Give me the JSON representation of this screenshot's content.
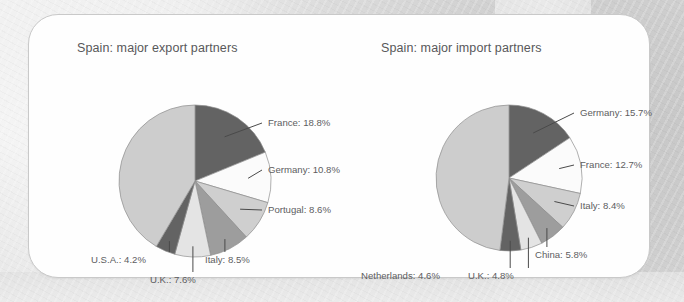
{
  "background": {
    "paper_color": "#d8d8d8",
    "card_color": "#fefefe"
  },
  "palette": {
    "dark_gray": "#636363",
    "white": "#fbfbfb",
    "light_gray": "#cfcfcf",
    "medium_gray": "#9d9d9d",
    "very_light_gray": "#e4e4e4",
    "remainder_gray": "#cdcdcd",
    "outline": "#8e8e8e",
    "text": "#5d5d5f",
    "title_text": "#58585a"
  },
  "chart_data": [
    {
      "type": "pie",
      "id": "export",
      "title": "Spain: major export partners",
      "start_angle_deg": 0,
      "direction": "clockwise",
      "unit": "%",
      "center": {
        "x": 166,
        "y": 166
      },
      "radius": 76,
      "categories": [
        "France",
        "Germany",
        "Portugal",
        "Italy",
        "U.K.",
        "U.S.A.",
        "Other"
      ],
      "values": [
        18.8,
        10.8,
        8.6,
        8.5,
        7.6,
        4.2,
        41.5
      ],
      "labels": [
        {
          "text": "France: 18.8%",
          "x": 239,
          "y": 111,
          "anchor": "start"
        },
        {
          "text": "Germany: 10.8%",
          "x": 239,
          "y": 158,
          "anchor": "start"
        },
        {
          "text": "Portugal: 8.6%",
          "x": 239,
          "y": 198,
          "anchor": "start"
        },
        {
          "text": "Italy: 8.5%",
          "x": 176,
          "y": 248,
          "anchor": "start"
        },
        {
          "text": "U.K.: 7.6%",
          "x": 121,
          "y": 268,
          "anchor": "start"
        },
        {
          "text": "U.S.A.: 4.2%",
          "x": 62,
          "y": 248,
          "anchor": "start"
        }
      ],
      "slice_colors": [
        "dark_gray",
        "white",
        "light_gray",
        "medium_gray",
        "very_light_gray",
        "dark_gray",
        "remainder_gray"
      ],
      "legend_position": "callout-labels",
      "grid": false
    },
    {
      "type": "pie",
      "id": "import",
      "title": "Spain: major import partners",
      "start_angle_deg": 0,
      "direction": "clockwise",
      "unit": "%",
      "center": {
        "x": 170,
        "y": 163
      },
      "radius": 73,
      "categories": [
        "Germany",
        "France",
        "Italy",
        "China",
        "U.K.",
        "Netherlands",
        "Other"
      ],
      "values": [
        15.7,
        12.7,
        8.4,
        5.8,
        4.8,
        4.6,
        48.0
      ],
      "labels": [
        {
          "text": "Germany: 15.7%",
          "x": 241,
          "y": 101,
          "anchor": "start"
        },
        {
          "text": "France: 12.7%",
          "x": 241,
          "y": 153,
          "anchor": "start"
        },
        {
          "text": "Italy: 8.4%",
          "x": 241,
          "y": 194,
          "anchor": "start"
        },
        {
          "text": "China: 5.8%",
          "x": 196,
          "y": 243,
          "anchor": "start"
        },
        {
          "text": "U.K.: 4.8%",
          "x": 129,
          "y": 264,
          "anchor": "start"
        },
        {
          "text": "Netherlands: 4.6%",
          "x": 22,
          "y": 264,
          "anchor": "start"
        }
      ],
      "slice_colors": [
        "dark_gray",
        "white",
        "light_gray",
        "medium_gray",
        "very_light_gray",
        "dark_gray",
        "remainder_gray"
      ],
      "legend_position": "callout-labels",
      "grid": false
    }
  ]
}
